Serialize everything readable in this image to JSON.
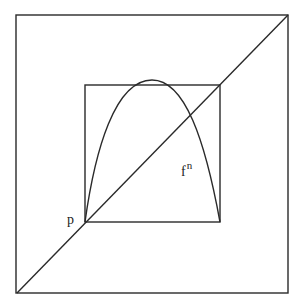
{
  "figure": {
    "colors": {
      "stroke": "#2a2a2a",
      "background": "#ffffff"
    },
    "outer_square": {
      "x1": 16,
      "y1": 15,
      "x2": 288,
      "y2": 293
    },
    "inner_square": {
      "x1": 85,
      "y1": 85,
      "x2": 220,
      "y2": 222
    },
    "diagonal": {
      "x1": 17,
      "y1": 293,
      "x2": 288,
      "y2": 15
    },
    "curve_label": {
      "base": "f",
      "superscript": "n"
    },
    "point_label": "p"
  }
}
